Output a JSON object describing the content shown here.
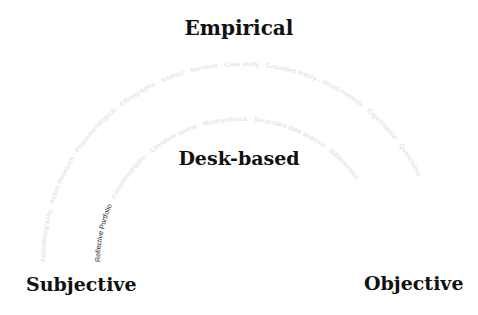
{
  "headings": {
    "top": "Empirical",
    "middle": "Desk-based",
    "left": "Subjective",
    "right": "Objective"
  },
  "outer_arc": {
    "labels": [
      "Autoethnography",
      "Action Research",
      "Phenomenological",
      "Ethnographic",
      "Artefact",
      "Narrative",
      "Case study",
      "Grounded theory",
      "Mixed methods",
      "Experimental",
      "Quantitative"
    ],
    "color": "#d9d9d9"
  },
  "inner_arc": {
    "labels": [
      "Reflective Portfolio",
      "Autoethnographic",
      "Literature review",
      "Metasynthesis",
      "Secondary data analysis",
      "Bibliometrics"
    ],
    "highlighted": "Reflective Portfolio",
    "highlight_color": "#222222",
    "color": "#d9d9d9"
  }
}
